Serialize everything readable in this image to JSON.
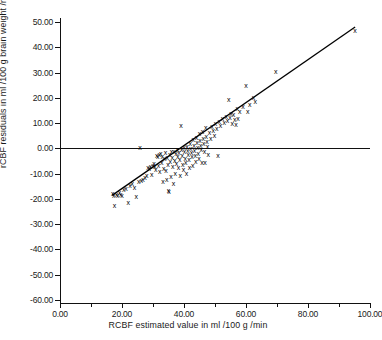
{
  "chart_data": {
    "type": "scatter",
    "title": "",
    "xlabel": "RCBF estimated value  in  ml /100 g /min",
    "ylabel": "rCBF residuals in ml /100 g brain weight /min",
    "xlim": [
      0,
      100
    ],
    "ylim": [
      -60,
      50
    ],
    "grid": false,
    "legend": null,
    "x_tick_labels": [
      "0.00",
      "20.00",
      "40.00",
      "60.00",
      "80.00",
      "100.00"
    ],
    "x_tick_values": [
      0,
      20,
      40,
      60,
      80,
      100
    ],
    "x_minor_ticks": [
      10,
      30,
      50,
      70,
      90
    ],
    "y_tick_labels": [
      "50.00",
      "40.00",
      "30.00",
      "20.00",
      "10.00",
      "0.00",
      "-10.00",
      "-20.00",
      "-30.00",
      "-40.00",
      "-50.00",
      "-60.00"
    ],
    "y_tick_values": [
      50,
      40,
      30,
      20,
      10,
      0,
      -10,
      -20,
      -30,
      -40,
      -50,
      -60
    ],
    "marker": "x",
    "reference_line": {
      "orientation": "horizontal",
      "y": 0
    },
    "fit_line": {
      "x0": 16.8,
      "y0": -18.6,
      "x1": 95.2,
      "y1": 48.0
    },
    "points": [
      [
        17.0,
        -17.6
      ],
      [
        17.3,
        -18.4
      ],
      [
        17.6,
        -22.3
      ],
      [
        18.2,
        -17.9
      ],
      [
        18.6,
        -18.6
      ],
      [
        19.2,
        -17.4
      ],
      [
        19.6,
        -18.0
      ],
      [
        20.0,
        -18.4
      ],
      [
        20.6,
        -16.0
      ],
      [
        21.3,
        -15.6
      ],
      [
        22.0,
        -21.1
      ],
      [
        22.6,
        -14.6
      ],
      [
        23.3,
        -13.8
      ],
      [
        24.0,
        -15.4
      ],
      [
        24.6,
        -18.9
      ],
      [
        25.4,
        -13.0
      ],
      [
        25.8,
        0.6
      ],
      [
        26.2,
        -12.4
      ],
      [
        26.8,
        -12.0
      ],
      [
        27.4,
        -11.3
      ],
      [
        28.0,
        -10.6
      ],
      [
        28.4,
        -7.3
      ],
      [
        28.8,
        -7.8
      ],
      [
        29.2,
        -6.9
      ],
      [
        29.6,
        -10.2
      ],
      [
        30.0,
        -6.4
      ],
      [
        30.3,
        -5.9
      ],
      [
        30.6,
        -7.1
      ],
      [
        30.9,
        -8.3
      ],
      [
        31.2,
        -2.6
      ],
      [
        31.5,
        -3.1
      ],
      [
        31.8,
        -6.6
      ],
      [
        32.0,
        -2.2
      ],
      [
        32.2,
        -9.0
      ],
      [
        32.5,
        -1.8
      ],
      [
        32.8,
        -5.2
      ],
      [
        33.0,
        -2.9
      ],
      [
        33.2,
        -13.0
      ],
      [
        33.5,
        -7.6
      ],
      [
        33.8,
        -4.0
      ],
      [
        34.0,
        -1.5
      ],
      [
        34.2,
        -8.6
      ],
      [
        34.4,
        -12.2
      ],
      [
        34.6,
        -3.6
      ],
      [
        34.8,
        -6.2
      ],
      [
        35.0,
        -16.3
      ],
      [
        35.2,
        -16.9
      ],
      [
        35.4,
        -2.4
      ],
      [
        35.6,
        -5.0
      ],
      [
        35.8,
        -11.0
      ],
      [
        36.0,
        -0.9
      ],
      [
        36.2,
        -3.3
      ],
      [
        36.4,
        -7.0
      ],
      [
        36.6,
        -13.6
      ],
      [
        36.8,
        -1.2
      ],
      [
        37.0,
        -4.6
      ],
      [
        37.2,
        -9.6
      ],
      [
        37.4,
        -2.0
      ],
      [
        37.6,
        -5.6
      ],
      [
        37.8,
        -0.4
      ],
      [
        38.0,
        -3.0
      ],
      [
        38.2,
        -7.4
      ],
      [
        38.4,
        -1.6
      ],
      [
        38.6,
        -4.2
      ],
      [
        38.8,
        -10.4
      ],
      [
        39.0,
        9.4
      ],
      [
        39.2,
        -0.2
      ],
      [
        39.4,
        -2.8
      ],
      [
        39.6,
        -6.0
      ],
      [
        39.8,
        -8.0
      ],
      [
        40.0,
        0.4
      ],
      [
        40.2,
        -1.0
      ],
      [
        40.4,
        -3.8
      ],
      [
        40.6,
        -5.4
      ],
      [
        40.8,
        -9.8
      ],
      [
        41.0,
        1.0
      ],
      [
        41.2,
        -0.6
      ],
      [
        41.4,
        -2.4
      ],
      [
        41.6,
        -4.4
      ],
      [
        41.8,
        -7.2
      ],
      [
        42.0,
        2.0
      ],
      [
        42.2,
        0.2
      ],
      [
        42.4,
        -1.4
      ],
      [
        42.6,
        -3.2
      ],
      [
        42.8,
        -6.4
      ],
      [
        43.0,
        3.6
      ],
      [
        43.2,
        1.4
      ],
      [
        43.4,
        -0.8
      ],
      [
        43.6,
        -2.6
      ],
      [
        43.8,
        -5.0
      ],
      [
        44.0,
        4.4
      ],
      [
        44.2,
        2.6
      ],
      [
        44.4,
        0.6
      ],
      [
        44.6,
        -1.8
      ],
      [
        44.8,
        -4.0
      ],
      [
        45.0,
        6.0
      ],
      [
        45.2,
        3.2
      ],
      [
        45.4,
        1.2
      ],
      [
        45.6,
        -0.4
      ],
      [
        45.8,
        -5.2
      ],
      [
        46.0,
        7.0
      ],
      [
        46.2,
        4.0
      ],
      [
        46.4,
        2.2
      ],
      [
        46.6,
        -1.0
      ],
      [
        46.8,
        -5.4
      ],
      [
        47.0,
        8.4
      ],
      [
        47.2,
        5.0
      ],
      [
        47.4,
        3.0
      ],
      [
        47.6,
        0.8
      ],
      [
        47.8,
        -2.2
      ],
      [
        48.2,
        6.6
      ],
      [
        48.6,
        4.2
      ],
      [
        49.0,
        9.0
      ],
      [
        49.4,
        7.4
      ],
      [
        49.8,
        5.2
      ],
      [
        50.2,
        10.2
      ],
      [
        50.6,
        8.2
      ],
      [
        51.0,
        -2.8
      ],
      [
        51.4,
        11.0
      ],
      [
        51.8,
        9.2
      ],
      [
        52.4,
        12.2
      ],
      [
        53.0,
        10.6
      ],
      [
        53.6,
        13.0
      ],
      [
        54.0,
        11.4
      ],
      [
        54.4,
        19.4
      ],
      [
        54.8,
        12.6
      ],
      [
        55.2,
        14.0
      ],
      [
        55.6,
        10.0
      ],
      [
        56.0,
        13.4
      ],
      [
        56.4,
        11.8
      ],
      [
        56.8,
        9.6
      ],
      [
        57.2,
        16.0
      ],
      [
        57.4,
        12.0
      ],
      [
        58.0,
        14.6
      ],
      [
        59.0,
        16.6
      ],
      [
        60.0,
        25.0
      ],
      [
        60.6,
        14.8
      ],
      [
        61.2,
        17.4
      ],
      [
        62.4,
        20.4
      ],
      [
        63.0,
        18.6
      ],
      [
        69.6,
        30.6
      ],
      [
        95.2,
        47.0
      ]
    ]
  }
}
